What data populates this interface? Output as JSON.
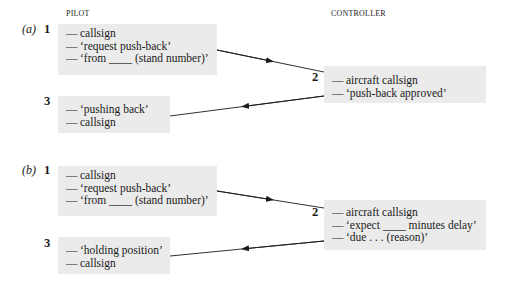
{
  "headers": {
    "pilot": "PILOT",
    "controller": "CONTROLLER"
  },
  "dash": "—",
  "parts": [
    {
      "label": "(a)",
      "steps": [
        {
          "number": "1",
          "role": "pilot",
          "lines": [
            "callsign",
            "‘request push-back’",
            "‘from ____ (stand number)’"
          ]
        },
        {
          "number": "2",
          "role": "controller",
          "lines": [
            "aircraft callsign",
            "‘push-back approved’"
          ]
        },
        {
          "number": "3",
          "role": "pilot",
          "lines": [
            "‘pushing back’",
            "callsign"
          ]
        }
      ]
    },
    {
      "label": "(b)",
      "steps": [
        {
          "number": "1",
          "role": "pilot",
          "lines": [
            "callsign",
            "‘request push-back’",
            "‘from ____ (stand number)’"
          ]
        },
        {
          "number": "2",
          "role": "controller",
          "lines": [
            "aircraft callsign",
            "‘expect ____ minutes delay’",
            "‘due . . . (reason)’"
          ]
        },
        {
          "number": "3",
          "role": "pilot",
          "lines": [
            "‘holding position’",
            "callsign"
          ]
        }
      ]
    }
  ],
  "colors": {
    "box_fill": "#ebebeb",
    "ink": "#1a1a1a"
  }
}
